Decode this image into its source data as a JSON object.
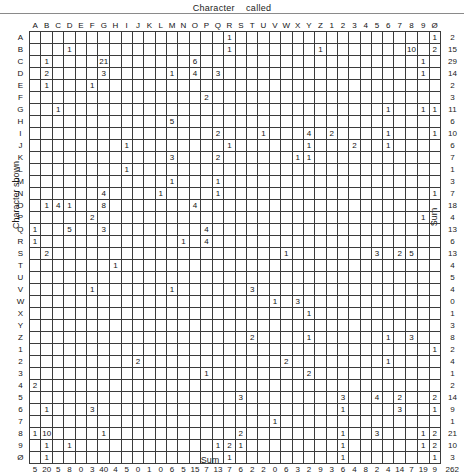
{
  "title": "Character    called",
  "y_axis_label": "Character  shown",
  "sum_label_right": "Sum",
  "sum_label_bottom": "Sum",
  "chart_data": {
    "type": "heatmap",
    "subtype": "confusion-matrix",
    "title": "Character    called",
    "xlabel": "Character called",
    "ylabel": "Character shown",
    "grid": true,
    "legend": "none",
    "categories": [
      "A",
      "B",
      "C",
      "D",
      "E",
      "F",
      "G",
      "H",
      "I",
      "J",
      "K",
      "L",
      "M",
      "N",
      "O",
      "P",
      "Q",
      "R",
      "S",
      "T",
      "U",
      "V",
      "W",
      "X",
      "Y",
      "Z",
      "1",
      "2",
      "3",
      "4",
      "5",
      "6",
      "7",
      "8",
      "9",
      "Ø"
    ],
    "row_labels": [
      "A",
      "B",
      "C",
      "D",
      "E",
      "F",
      "G",
      "H",
      "I",
      "J",
      "K",
      "L",
      "M",
      "N",
      "O",
      "P",
      "Q",
      "R",
      "S",
      "T",
      "U",
      "V",
      "W",
      "X",
      "Y",
      "Z",
      "1",
      "2",
      "3",
      "4",
      "5",
      "6",
      "7",
      "8",
      "9",
      "Ø"
    ],
    "column_labels": [
      "A",
      "B",
      "C",
      "D",
      "E",
      "F",
      "G",
      "H",
      "I",
      "J",
      "K",
      "L",
      "M",
      "N",
      "O",
      "P",
      "Q",
      "R",
      "S",
      "T",
      "U",
      "V",
      "W",
      "X",
      "Y",
      "Z",
      "1",
      "2",
      "3",
      "4",
      "5",
      "6",
      "7",
      "8",
      "9",
      "Ø"
    ],
    "matrix": [
      [
        "",
        "",
        "",
        "",
        "",
        "",
        "",
        "",
        "",
        "",
        "",
        "",
        "",
        "",
        "",
        "",
        "",
        "1",
        "",
        "",
        "",
        "",
        "",
        "",
        "",
        "",
        "",
        "",
        "",
        "",
        "",
        "",
        "",
        "",
        "",
        "1"
      ],
      [
        "",
        "",
        "",
        "1",
        "",
        "",
        "",
        "",
        "",
        "",
        "",
        "",
        "",
        "",
        "",
        "",
        "",
        "1",
        "",
        "",
        "",
        "",
        "",
        "",
        "",
        "1",
        "",
        "",
        "",
        "",
        "",
        "",
        "",
        "10",
        "",
        "2"
      ],
      [
        "",
        "1",
        "",
        "",
        "",
        "",
        "21",
        "",
        "",
        "",
        "",
        "",
        "",
        "",
        "6",
        "",
        "",
        "",
        "",
        "",
        "",
        "",
        "",
        "",
        "",
        "",
        "",
        "",
        "",
        "",
        "",
        "",
        "",
        "",
        "1",
        ""
      ],
      [
        "",
        "2",
        "",
        "",
        "",
        "",
        "3",
        "",
        "",
        "",
        "",
        "",
        "1",
        "",
        "4",
        "",
        "3",
        "",
        "",
        "",
        "",
        "",
        "",
        "",
        "",
        "",
        "",
        "",
        "",
        "",
        "",
        "",
        "",
        "",
        "1",
        ""
      ],
      [
        "",
        "1",
        "",
        "",
        "",
        "1",
        "",
        "",
        "",
        "",
        "",
        "",
        "",
        "",
        "",
        "",
        "",
        "",
        "",
        "",
        "",
        "",
        "",
        "",
        "",
        "",
        "",
        "",
        "",
        "",
        "",
        "",
        "",
        "",
        "",
        ""
      ],
      [
        "",
        "",
        "",
        "",
        "",
        "",
        "",
        "",
        "",
        "",
        "",
        "",
        "",
        "",
        "",
        "2",
        "",
        "",
        "",
        "",
        "",
        "",
        "",
        "",
        "",
        "",
        "",
        "",
        "",
        "",
        "",
        "",
        "",
        "",
        "",
        ""
      ],
      [
        "",
        "",
        "1",
        "",
        "",
        "",
        "",
        "",
        "",
        "",
        "",
        "",
        "",
        "",
        "",
        "",
        "",
        "",
        "",
        "",
        "",
        "",
        "",
        "",
        "",
        "",
        "",
        "",
        "",
        "",
        "",
        "1",
        "",
        "",
        "1",
        "1"
      ],
      [
        "",
        "",
        "",
        "",
        "",
        "",
        "",
        "",
        "",
        "",
        "",
        "",
        "5",
        "",
        "",
        "",
        "",
        "",
        "",
        "",
        "",
        "",
        "",
        "",
        "",
        "",
        "",
        "",
        "",
        "",
        "",
        "",
        "",
        "",
        "",
        ""
      ],
      [
        "",
        "",
        "",
        "",
        "",
        "",
        "",
        "",
        "",
        "",
        "",
        "",
        "",
        "",
        "",
        "",
        "2",
        "",
        "",
        "",
        "1",
        "",
        "",
        "",
        "4",
        "",
        "2",
        "",
        "",
        "",
        "",
        "1",
        "",
        "",
        "",
        "1"
      ],
      [
        "",
        "",
        "",
        "",
        "",
        "",
        "",
        "",
        "1",
        "",
        "",
        "",
        "",
        "",
        "",
        "",
        "",
        "1",
        "",
        "",
        "",
        "",
        "",
        "",
        "1",
        "",
        "",
        "",
        "2",
        "",
        "",
        "1",
        "",
        "",
        "",
        ""
      ],
      [
        "",
        "",
        "",
        "",
        "",
        "",
        "",
        "",
        "",
        "",
        "",
        "",
        "3",
        "",
        "",
        "",
        "2",
        "",
        "",
        "",
        "",
        "",
        "",
        "1",
        "1",
        "",
        "",
        "",
        "",
        "",
        "",
        "",
        "",
        "",
        "",
        ""
      ],
      [
        "",
        "",
        "",
        "",
        "",
        "",
        "",
        "",
        "1",
        "",
        "",
        "",
        "",
        "",
        "",
        "",
        "",
        "",
        "",
        "",
        "",
        "",
        "",
        "",
        "",
        "",
        "",
        "",
        "",
        "",
        "",
        "",
        "",
        "",
        "",
        ""
      ],
      [
        "",
        "",
        "",
        "",
        "",
        "",
        "",
        "",
        "",
        "",
        "",
        "",
        "1",
        "",
        "",
        "",
        "1",
        "",
        "",
        "",
        "",
        "",
        "",
        "",
        "",
        "",
        "",
        "",
        "",
        "",
        "",
        "",
        "",
        "",
        "",
        ""
      ],
      [
        "",
        "",
        "",
        "",
        "",
        "",
        "4",
        "",
        "",
        "",
        "",
        "1",
        "",
        "",
        "",
        "",
        "1",
        "",
        "",
        "",
        "",
        "",
        "",
        "",
        "",
        "",
        "",
        "",
        "",
        "",
        "",
        "",
        "",
        "",
        "",
        "1"
      ],
      [
        "",
        "1",
        "4",
        "1",
        "",
        "",
        "8",
        "",
        "",
        "",
        "",
        "",
        "",
        "",
        "4",
        "",
        "",
        "",
        "",
        "",
        "",
        "",
        "",
        "",
        "",
        "",
        "",
        "",
        "",
        "",
        "",
        "",
        "",
        "",
        "",
        ""
      ],
      [
        "",
        "",
        "",
        "",
        "",
        "2",
        "",
        "",
        "",
        "",
        "",
        "",
        "",
        "",
        "",
        "",
        "",
        "",
        "",
        "",
        "",
        "",
        "",
        "",
        "",
        "",
        "",
        "",
        "",
        "",
        "",
        "",
        "",
        "",
        "1",
        ""
      ],
      [
        "1",
        "",
        "",
        "5",
        "",
        "",
        "3",
        "",
        "",
        "",
        "",
        "",
        "",
        "",
        "",
        "4",
        "",
        "",
        "",
        "",
        "",
        "",
        "",
        "",
        "",
        "",
        "",
        "",
        "",
        "",
        "",
        "",
        "",
        "",
        "",
        ""
      ],
      [
        "1",
        "",
        "",
        "",
        "",
        "",
        "",
        "",
        "",
        "",
        "",
        "",
        "",
        "1",
        "",
        "4",
        "",
        "",
        "",
        "",
        "",
        "",
        "",
        "",
        "",
        "",
        "",
        "",
        "",
        "",
        "",
        "",
        "",
        "",
        "",
        ""
      ],
      [
        "",
        "2",
        "",
        "",
        "",
        "",
        "",
        "",
        "",
        "",
        "",
        "",
        "",
        "",
        "",
        "",
        "",
        "",
        "",
        "",
        "",
        "",
        "1",
        "",
        "",
        "",
        "",
        "",
        "",
        "",
        "3",
        "",
        "2",
        "5",
        "",
        ""
      ],
      [
        "",
        "",
        "",
        "",
        "",
        "",
        "",
        "1",
        "",
        "",
        "",
        "",
        "",
        "",
        "",
        "",
        "",
        "",
        "",
        "",
        "",
        "",
        "",
        "",
        "",
        "",
        "",
        "",
        "",
        "",
        "",
        "",
        "",
        "",
        "",
        ""
      ],
      [
        "",
        "",
        "",
        "",
        "",
        "",
        "",
        "",
        "",
        "",
        "",
        "",
        "",
        "",
        "",
        "",
        "",
        "",
        "",
        "",
        "",
        "",
        "",
        "",
        "",
        "",
        "",
        "",
        "",
        "",
        "",
        "",
        "",
        "",
        "",
        ""
      ],
      [
        "",
        "",
        "",
        "",
        "",
        "1",
        "",
        "",
        "",
        "",
        "",
        "",
        "1",
        "",
        "",
        "",
        "",
        "",
        "",
        "3",
        "",
        "",
        "",
        "",
        "",
        "",
        "",
        "",
        "",
        "",
        "",
        "",
        "",
        "",
        "",
        ""
      ],
      [
        "",
        "",
        "",
        "",
        "",
        "",
        "",
        "",
        "",
        "",
        "",
        "",
        "",
        "",
        "",
        "",
        "",
        "",
        "",
        "",
        "",
        "1",
        "",
        "3",
        "",
        "",
        "",
        "",
        "",
        "",
        "",
        "",
        "",
        "",
        "",
        ""
      ],
      [
        "",
        "",
        "",
        "",
        "",
        "",
        "",
        "",
        "",
        "",
        "",
        "",
        "",
        "",
        "",
        "",
        "",
        "",
        "",
        "",
        "",
        "",
        "",
        "",
        "1",
        "",
        "",
        "",
        "",
        "",
        "",
        "",
        "",
        "",
        "",
        ""
      ],
      [
        "",
        "",
        "",
        "",
        "",
        "",
        "",
        "",
        "",
        "",
        "",
        "",
        "",
        "",
        "",
        "",
        "",
        "",
        "",
        "",
        "",
        "",
        "",
        "",
        "",
        "",
        "",
        "",
        "",
        "",
        "",
        "",
        "",
        "",
        "",
        ""
      ],
      [
        "",
        "",
        "",
        "",
        "",
        "",
        "",
        "",
        "",
        "",
        "",
        "",
        "",
        "",
        "",
        "",
        "",
        "",
        "",
        "2",
        "",
        "",
        "",
        "",
        "1",
        "",
        "",
        "",
        "",
        "",
        "",
        "1",
        "",
        "3",
        "",
        ""
      ],
      [
        "",
        "",
        "",
        "",
        "",
        "",
        "",
        "",
        "",
        "",
        "",
        "",
        "",
        "",
        "",
        "",
        "",
        "",
        "",
        "",
        "",
        "",
        "",
        "",
        "",
        "",
        "",
        "",
        "",
        "",
        "",
        "",
        "",
        "",
        "",
        "1"
      ],
      [
        "",
        "",
        "",
        "",
        "",
        "",
        "",
        "",
        "",
        "2",
        "",
        "",
        "",
        "",
        "",
        "",
        "",
        "",
        "",
        "",
        "",
        "",
        "2",
        "",
        "",
        "",
        "",
        "",
        "",
        "",
        "",
        "1",
        "",
        "",
        "",
        ""
      ],
      [
        "",
        "",
        "",
        "",
        "",
        "",
        "",
        "",
        "",
        "",
        "",
        "",
        "",
        "",
        "",
        "1",
        "",
        "",
        "",
        "",
        "",
        "",
        "",
        "",
        "2",
        "",
        "",
        "",
        "",
        "",
        "",
        "",
        "",
        "",
        "",
        ""
      ],
      [
        "2",
        "",
        "",
        "",
        "",
        "",
        "",
        "",
        "",
        "",
        "",
        "",
        "",
        "",
        "",
        "",
        "",
        "",
        "",
        "",
        "",
        "",
        "",
        "",
        "",
        "",
        "",
        "",
        "",
        "",
        "",
        "",
        "",
        "",
        "",
        ""
      ],
      [
        "",
        "",
        "",
        "",
        "",
        "",
        "",
        "",
        "",
        "",
        "",
        "",
        "",
        "",
        "",
        "",
        "",
        "",
        "3",
        "",
        "",
        "",
        "",
        "",
        "",
        "",
        "",
        "3",
        "",
        "",
        "4",
        "",
        "2",
        "",
        "",
        "2"
      ],
      [
        "",
        "1",
        "",
        "",
        "",
        "3",
        "",
        "",
        "",
        "",
        "",
        "",
        "",
        "",
        "",
        "",
        "",
        "",
        "",
        "",
        "",
        "",
        "",
        "",
        "",
        "",
        "",
        "1",
        "",
        "",
        "",
        "",
        "3",
        "",
        "",
        "1"
      ],
      [
        "",
        "",
        "",
        "",
        "",
        "",
        "",
        "",
        "",
        "",
        "",
        "",
        "",
        "",
        "",
        "",
        "",
        "",
        "",
        "",
        "",
        "1",
        "",
        "",
        "",
        "",
        "",
        "",
        "",
        "",
        "",
        "",
        "",
        "",
        "",
        ""
      ],
      [
        "1",
        "10",
        "",
        "",
        "",
        "",
        "1",
        "",
        "",
        "",
        "",
        "",
        "",
        "",
        "",
        "",
        "",
        "",
        "2",
        "",
        "",
        "",
        "",
        "",
        "",
        "",
        "",
        "1",
        "",
        "",
        "3",
        "",
        "",
        "",
        "1",
        "2"
      ],
      [
        "",
        "1",
        "",
        "1",
        "",
        "",
        "",
        "",
        "",
        "",
        "",
        "",
        "",
        "",
        "",
        "",
        "1",
        "2",
        "1",
        "",
        "",
        "",
        "",
        "",
        "",
        "",
        "",
        "1",
        "",
        "",
        "",
        "",
        "",
        "",
        "1",
        "2"
      ],
      [
        "",
        "1",
        "",
        "",
        "",
        "",
        "",
        "",
        "",
        "",
        "",
        "",
        "",
        "",
        "",
        "",
        "",
        "1",
        "",
        "",
        "",
        "",
        "",
        "",
        "",
        "",
        "",
        "1",
        "",
        "",
        "",
        "",
        "",
        "",
        "",
        "1"
      ]
    ],
    "row_sums": [
      2,
      15,
      29,
      14,
      2,
      3,
      11,
      6,
      10,
      6,
      7,
      1,
      3,
      7,
      18,
      4,
      13,
      6,
      13,
      4,
      5,
      4,
      0,
      1,
      3,
      8,
      2,
      4,
      1,
      2,
      14,
      9,
      1,
      21,
      10,
      3
    ],
    "col_sums": [
      5,
      20,
      5,
      8,
      0,
      3,
      40,
      4,
      5,
      0,
      1,
      0,
      6,
      5,
      15,
      7,
      13,
      7,
      6,
      2,
      2,
      0,
      6,
      3,
      2,
      9,
      3,
      6,
      4,
      8,
      2,
      4,
      14,
      7,
      19,
      9
    ],
    "grand_total": 262,
    "total_label_row": 14
  }
}
